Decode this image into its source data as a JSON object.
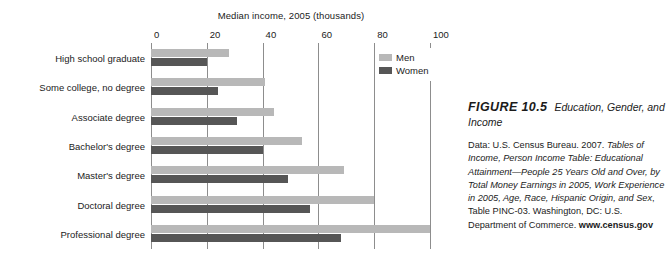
{
  "chart_data": {
    "type": "bar",
    "orientation": "horizontal",
    "title": "Median income, 2005 (thousands)",
    "xlabel": "Median income, 2005 (thousands)",
    "ylabel": "",
    "xlim": [
      0,
      100
    ],
    "xticks": [
      0,
      20,
      40,
      60,
      80,
      100
    ],
    "grid": true,
    "legend_position": "top-right",
    "categories": [
      "High school graduate",
      "Some college, no degree",
      "Associate degree",
      "Bachelor's degree",
      "Master's degree",
      "Doctoral degree",
      "Professional degree"
    ],
    "series": [
      {
        "name": "Men",
        "color": "#b8b8b8",
        "values": [
          28,
          41,
          44,
          54,
          69,
          80,
          100
        ]
      },
      {
        "name": "Women",
        "color": "#565656",
        "values": [
          20,
          24,
          31,
          40,
          49,
          57,
          68
        ]
      }
    ]
  },
  "axis": {
    "ticks": [
      "0",
      "20",
      "40",
      "60",
      "80",
      "100"
    ]
  },
  "legend": {
    "items": [
      {
        "label": "Men"
      },
      {
        "label": "Women"
      }
    ]
  },
  "caption": {
    "figure_number": "FIGURE 10.5",
    "figure_name": "Education, Gender, and Income",
    "data_prefix": "Data: U.S. Census Bureau. 2007. ",
    "source_title": "Tables of Income, Person Income Table: Educational Attainment—People 25 Years Old and Over, by Total Money Earnings in 2005, Work Experience in 2005, Age, Race, Hispanic Origin, and Sex",
    "table_ref": ", Table PINC-03. Washington, DC: U.S. Department of Commerce. ",
    "url": "www.census.gov"
  }
}
